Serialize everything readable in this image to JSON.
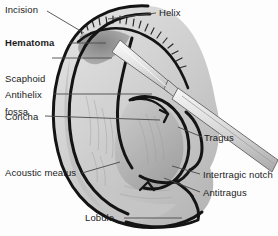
{
  "figure": {
    "style": "grayscale medical line illustration",
    "background_color": "#fdfdfd",
    "ink_color": "#1b1b1b",
    "leader_line_color": "#4a4a4a"
  },
  "labels": {
    "incision": "Incision",
    "hematoma": "Hematoma",
    "scaphoid_fossa_line1": "Scaphoid",
    "scaphoid_fossa_line2": "fossa",
    "antihelix": "Antihelix",
    "concha": "Concha",
    "acoustic_meatus": "Acoustic meatus",
    "lobule": "Lobule",
    "helix": "Helix",
    "tragus": "Tragus",
    "intertragic_notch": "Intertragic notch",
    "antitragus": "Antitragus"
  },
  "emphasis": {
    "bold_labels": [
      "Hematoma"
    ]
  },
  "illustration_parts": {
    "ear_outline": "auricle-outline",
    "helix_rim": "helix-rim",
    "antihelix_ridge": "antihelix-ridge",
    "concha_bowl": "concha-bowl",
    "tragus_flap": "tragus-flap",
    "antitragus_flap": "antitragus-flap",
    "intertragic_notch": "intertragic-notch",
    "lobule": "earlobe",
    "hematoma_shading": "hematoma-swelling",
    "incision_hatching": "incision-hatch-marks",
    "instrument": "scalpel"
  },
  "colors": {
    "skin_light": "#d9d9d9",
    "skin_mid": "#c2c2c2",
    "skin_shadow": "#a8a8a8",
    "hematoma_dark": "#8d8d8d",
    "outline": "#141414",
    "blade_light": "#f2f2f2",
    "blade_shadow": "#bdbdbd"
  }
}
